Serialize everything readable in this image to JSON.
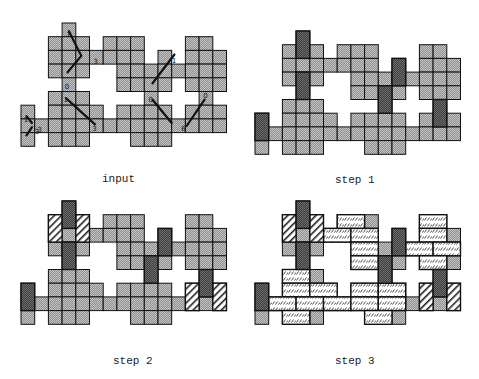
{
  "figure": {
    "cell_size": 13.7,
    "colors": {
      "free_cell": "#8f8f8f",
      "free_cell_dots": "#c8c8c8",
      "vertical_domino_dark": "#4a4a4a",
      "vertical_domino_dark_dots": "#777777",
      "hatched_fill": "#ffffff",
      "hatched_stroke": "#222222",
      "brick_fill": "#ffffff",
      "brick_stroke": "#333333",
      "border": "#111111",
      "arrow": "#111111"
    },
    "footprint": [
      [
        0,
        3
      ],
      [
        1,
        2
      ],
      [
        1,
        3
      ],
      [
        1,
        4
      ],
      [
        1,
        6
      ],
      [
        1,
        7
      ],
      [
        1,
        8
      ],
      [
        1,
        12
      ],
      [
        1,
        13
      ],
      [
        2,
        2
      ],
      [
        2,
        3
      ],
      [
        2,
        4
      ],
      [
        2,
        5
      ],
      [
        2,
        6
      ],
      [
        2,
        7
      ],
      [
        2,
        8
      ],
      [
        2,
        10
      ],
      [
        2,
        12
      ],
      [
        2,
        13
      ],
      [
        2,
        14
      ],
      [
        3,
        2
      ],
      [
        3,
        3
      ],
      [
        3,
        4
      ],
      [
        3,
        7
      ],
      [
        3,
        8
      ],
      [
        3,
        9
      ],
      [
        3,
        10
      ],
      [
        3,
        11
      ],
      [
        3,
        12
      ],
      [
        3,
        13
      ],
      [
        3,
        14
      ],
      [
        4,
        3
      ],
      [
        4,
        7
      ],
      [
        4,
        8
      ],
      [
        4,
        9
      ],
      [
        4,
        10
      ],
      [
        4,
        12
      ],
      [
        4,
        13
      ],
      [
        4,
        14
      ],
      [
        5,
        2
      ],
      [
        5,
        3
      ],
      [
        5,
        4
      ],
      [
        5,
        9
      ],
      [
        5,
        13
      ],
      [
        6,
        0
      ],
      [
        6,
        2
      ],
      [
        6,
        3
      ],
      [
        6,
        4
      ],
      [
        6,
        5
      ],
      [
        6,
        7
      ],
      [
        6,
        8
      ],
      [
        6,
        9
      ],
      [
        6,
        10
      ],
      [
        6,
        12
      ],
      [
        6,
        13
      ],
      [
        6,
        14
      ],
      [
        7,
        0
      ],
      [
        7,
        1
      ],
      [
        7,
        2
      ],
      [
        7,
        3
      ],
      [
        7,
        4
      ],
      [
        7,
        5
      ],
      [
        7,
        6
      ],
      [
        7,
        7
      ],
      [
        7,
        8
      ],
      [
        7,
        9
      ],
      [
        7,
        10
      ],
      [
        7,
        11
      ],
      [
        7,
        12
      ],
      [
        7,
        13
      ],
      [
        7,
        14
      ],
      [
        8,
        0
      ],
      [
        8,
        2
      ],
      [
        8,
        3
      ],
      [
        8,
        4
      ],
      [
        8,
        8
      ],
      [
        8,
        9
      ],
      [
        8,
        10
      ]
    ]
  },
  "panels": [
    {
      "id": "input",
      "caption": "input",
      "origin": [
        21,
        23
      ],
      "caption_pos": [
        102,
        173
      ],
      "dark_vertical": [],
      "hatched_vertical": [],
      "brick_horizontal": [],
      "arrows": [
        {
          "from": [
            3.5,
            0.6
          ],
          "to": [
            4.4,
            2.4
          ],
          "label": "1",
          "label_at": [
            3.3,
            0.7
          ]
        },
        {
          "from": [
            4.4,
            2.4
          ],
          "to": [
            3.4,
            3.6
          ],
          "label": "3",
          "label_at": [
            5.3,
            2.7
          ]
        },
        {
          "from": [
            3.3,
            5.5
          ],
          "to": [
            5.4,
            7.4
          ],
          "label": "1",
          "label_at": [
            3.1,
            5.5
          ]
        },
        {
          "from": [
            11.2,
            2.3
          ],
          "to": [
            9.6,
            4.4
          ],
          "label": "1",
          "label_at": [
            11.0,
            2.6
          ]
        },
        {
          "from": [
            9.6,
            5.6
          ],
          "to": [
            11.0,
            7.3
          ],
          "label": "0",
          "label_at": [
            9.3,
            5.5
          ]
        },
        {
          "from": [
            13.4,
            5.6
          ],
          "to": [
            12.1,
            7.5
          ],
          "label": "0",
          "label_at": [
            13.3,
            5.2
          ]
        },
        {
          "from": [
            0.4,
            6.8
          ],
          "to": [
            0.8,
            7.3
          ],
          "label": "1",
          "label_at": [
            0.2,
            6.9
          ]
        },
        {
          "from": [
            0.8,
            7.6
          ],
          "to": [
            0.4,
            8.2
          ],
          "label": "3",
          "label_at": [
            1.0,
            7.8
          ]
        }
      ],
      "extra_labels": [
        {
          "text": "3",
          "at": [
            5.2,
            7.6
          ]
        },
        {
          "text": "0",
          "at": [
            3.2,
            4.5
          ]
        },
        {
          "text": "6",
          "at": [
            11.7,
            7.6
          ]
        },
        {
          "text": "3",
          "at": [
            1.2,
            7.7
          ]
        }
      ]
    },
    {
      "id": "step1",
      "caption": "step 1",
      "origin": [
        255,
        31
      ],
      "caption_pos": [
        335,
        174
      ],
      "dark_vertical": [
        [
          0,
          3
        ],
        [
          3,
          3
        ],
        [
          2,
          10
        ],
        [
          4,
          9
        ],
        [
          5,
          13
        ],
        [
          6,
          0
        ]
      ],
      "hatched_vertical": [],
      "brick_horizontal": [],
      "arrows": [],
      "extra_labels": []
    },
    {
      "id": "step2",
      "caption": "step 2",
      "origin": [
        21,
        201
      ],
      "caption_pos": [
        113,
        355
      ],
      "dark_vertical": [
        [
          0,
          3
        ],
        [
          3,
          3
        ],
        [
          2,
          10
        ],
        [
          4,
          9
        ],
        [
          5,
          13
        ],
        [
          6,
          0
        ]
      ],
      "hatched_vertical": [
        [
          1,
          2
        ],
        [
          1,
          4
        ],
        [
          6,
          12
        ],
        [
          6,
          14
        ]
      ],
      "brick_horizontal": [],
      "arrows": [],
      "extra_labels": []
    },
    {
      "id": "step3",
      "caption": "step 3",
      "origin": [
        255,
        201
      ],
      "caption_pos": [
        335,
        355
      ],
      "dark_vertical": [
        [
          0,
          3
        ],
        [
          3,
          3
        ],
        [
          2,
          10
        ],
        [
          4,
          9
        ],
        [
          5,
          13
        ],
        [
          6,
          0
        ]
      ],
      "hatched_vertical": [
        [
          1,
          2
        ],
        [
          1,
          4
        ],
        [
          6,
          12
        ],
        [
          6,
          14
        ]
      ],
      "brick_horizontal": [
        [
          1,
          6
        ],
        [
          1,
          12
        ],
        [
          2,
          5
        ],
        [
          2,
          7
        ],
        [
          2,
          12
        ],
        [
          3,
          7
        ],
        [
          3,
          11
        ],
        [
          3,
          13
        ],
        [
          4,
          7
        ],
        [
          4,
          12
        ],
        [
          5,
          2
        ],
        [
          6,
          2
        ],
        [
          6,
          4
        ],
        [
          6,
          7
        ],
        [
          6,
          9
        ],
        [
          7,
          1
        ],
        [
          7,
          3
        ],
        [
          7,
          5
        ],
        [
          7,
          7
        ],
        [
          7,
          9
        ],
        [
          8,
          2
        ],
        [
          8,
          8
        ]
      ],
      "arrows": [],
      "extra_labels": []
    }
  ]
}
